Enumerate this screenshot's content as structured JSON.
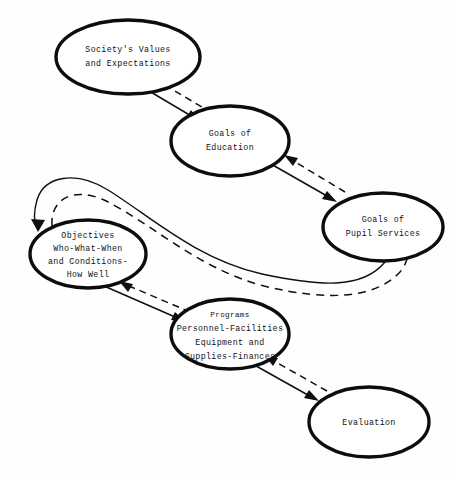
{
  "diagram": {
    "background_color": "#fefefe",
    "ink_color": "#101010",
    "nodes": [
      {
        "id": "society",
        "name": "society-values-node",
        "lines": [
          "Society's Values",
          "and Expectations"
        ],
        "cx": 128,
        "cy": 57,
        "rx": 72,
        "ry": 37
      },
      {
        "id": "goals_education",
        "name": "goals-of-education-node",
        "lines": [
          "Goals of",
          "Education"
        ],
        "cx": 230,
        "cy": 141,
        "rx": 59,
        "ry": 35
      },
      {
        "id": "goals_pupil",
        "name": "goals-of-pupil-services-node",
        "lines": [
          "Goals of",
          "Pupil Services"
        ],
        "cx": 383,
        "cy": 227,
        "rx": 60,
        "ry": 34
      },
      {
        "id": "objectives",
        "name": "objectives-node",
        "lines": [
          "Objectives",
          "Who-What-When",
          "and Conditions-",
          "How Well"
        ],
        "cx": 88,
        "cy": 254,
        "rx": 58,
        "ry": 34
      },
      {
        "id": "programs",
        "name": "programs-node",
        "lines": [
          "Programs",
          "Personnel-Facilities",
          "Equipment and",
          "Supplies-Finances"
        ],
        "cx": 230,
        "cy": 334,
        "rx": 59,
        "ry": 35
      },
      {
        "id": "evaluation",
        "name": "evaluation-node",
        "lines": [
          "Evaluation"
        ],
        "cx": 369,
        "cy": 422,
        "rx": 60,
        "ry": 35
      }
    ],
    "edges": [
      {
        "id": "society-to-education",
        "name": "edge-society-to-education",
        "style": "solid",
        "from": "society",
        "to": "goals_education",
        "direction": "forward"
      },
      {
        "id": "education-to-society",
        "name": "edge-education-to-society",
        "style": "dashed",
        "from": "goals_education",
        "to": "society",
        "direction": "feedback"
      },
      {
        "id": "education-to-pupil",
        "name": "edge-education-to-pupil-services",
        "style": "solid",
        "from": "goals_education",
        "to": "goals_pupil",
        "direction": "forward"
      },
      {
        "id": "pupil-to-education",
        "name": "edge-pupil-services-to-education",
        "style": "dashed",
        "from": "goals_pupil",
        "to": "goals_education",
        "direction": "feedback"
      },
      {
        "id": "pupil-to-objectives",
        "name": "edge-pupil-services-to-objectives",
        "style": "solid",
        "from": "goals_pupil",
        "to": "objectives",
        "direction": "forward"
      },
      {
        "id": "objectives-to-pupil",
        "name": "edge-objectives-to-pupil-services",
        "style": "dashed",
        "from": "objectives",
        "to": "goals_pupil",
        "direction": "feedback"
      },
      {
        "id": "objectives-to-programs",
        "name": "edge-objectives-to-programs",
        "style": "solid",
        "from": "objectives",
        "to": "programs",
        "direction": "forward"
      },
      {
        "id": "programs-to-objectives",
        "name": "edge-programs-to-objectives",
        "style": "dashed",
        "from": "programs",
        "to": "objectives",
        "direction": "feedback"
      },
      {
        "id": "programs-to-evaluation",
        "name": "edge-programs-to-evaluation",
        "style": "solid",
        "from": "programs",
        "to": "evaluation",
        "direction": "forward"
      },
      {
        "id": "evaluation-to-programs",
        "name": "edge-evaluation-to-programs",
        "style": "dashed",
        "from": "evaluation",
        "to": "programs",
        "direction": "feedback"
      }
    ]
  }
}
